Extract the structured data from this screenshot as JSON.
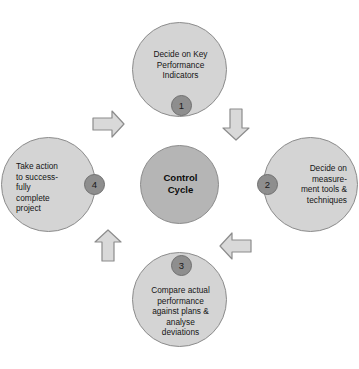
{
  "diagram": {
    "title": "Control Cycle",
    "type": "cycle-diagram",
    "colors": {
      "background": "#ffffff",
      "node_fill": "#d4d4d4",
      "node_stroke": "#8c8c8c",
      "center_fill": "#b5b5b5",
      "badge_fill": "#8e8e8e",
      "badge_stroke": "#6f6f6f",
      "arrow_fill": "#d9d9d9",
      "arrow_stroke": "#8c8c8c",
      "text": "#141414"
    },
    "center": {
      "label": "Control\nCycle"
    },
    "steps": [
      {
        "number": "1",
        "label": "Decide on Key\nPerformance\nIndicators",
        "position": "top",
        "text_align": "center",
        "badge_position": "bottom"
      },
      {
        "number": "2",
        "label": "Decide on\nmeasure-\nment tools &\ntechniques",
        "position": "right",
        "text_align": "right",
        "badge_position": "left"
      },
      {
        "number": "3",
        "label": "Compare actual\nperformance\nagainst plans &\nanalyse\ndeviations",
        "position": "bottom",
        "text_align": "center",
        "badge_position": "top"
      },
      {
        "number": "4",
        "label": "Take action\nto success-\nfully\ncomplete\nproject",
        "position": "left",
        "text_align": "left",
        "badge_position": "right"
      }
    ],
    "arrows": [
      {
        "name": "arrow-1-to-2",
        "direction": "down-right",
        "from": "1",
        "to": "2"
      },
      {
        "name": "arrow-2-to-3",
        "direction": "down-left",
        "from": "2",
        "to": "3"
      },
      {
        "name": "arrow-3-to-4",
        "direction": "up-left",
        "from": "3",
        "to": "4"
      },
      {
        "name": "arrow-4-to-1",
        "direction": "up-right",
        "from": "4",
        "to": "1"
      }
    ]
  }
}
